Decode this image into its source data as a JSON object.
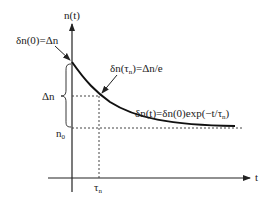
{
  "diagram": {
    "y_axis_label": "n(t)",
    "x_axis_label": "t",
    "initial_label": "δn(0)=Δn",
    "tau_point_label_pre": "δn(τ",
    "tau_point_label_sub": "n",
    "tau_point_label_post": ")=Δn/e",
    "equation_pre": "δn(t)=δn(0)exp(−t/τ",
    "equation_sub": "n",
    "equation_post": ")",
    "delta_n_label": "Δn",
    "n0_label": "n",
    "n0_sub": "0",
    "tau_label": "τ",
    "tau_sub": "n",
    "colors": {
      "line": "#222222",
      "dashed": "#444444",
      "background": "#ffffff"
    }
  }
}
